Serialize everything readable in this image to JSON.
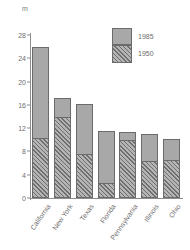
{
  "chart_data": {
    "type": "bar",
    "stacked": true,
    "title": "",
    "subtitle": "",
    "xlabel": "",
    "ylabel": "m",
    "unit_label": "m",
    "categories": [
      "California",
      "New York",
      "Texas",
      "Florida",
      "Pennsylvania",
      "Illinois",
      "Ohio"
    ],
    "series": [
      {
        "name": "1950",
        "values": [
          10.3,
          14.0,
          7.5,
          2.6,
          10.0,
          6.4,
          6.6
        ]
      },
      {
        "name": "1985",
        "values": [
          26.0,
          17.1,
          16.1,
          11.5,
          11.3,
          11.0,
          10.2
        ]
      }
    ],
    "note": "1985 values are cumulative bar tops; the 1950 segment is the hatched lower portion of each bar",
    "ylim": [
      0,
      28
    ],
    "yticks": [
      0,
      4,
      8,
      12,
      16,
      20,
      24,
      28
    ],
    "ytick_labels": [
      "0",
      "4",
      "8",
      "12",
      "16",
      "20",
      "24",
      "28"
    ],
    "grid": false,
    "legend_position": "top-right",
    "legend": [
      {
        "label": "1985",
        "swatch": "solid-gray"
      },
      {
        "label": "1950",
        "swatch": "hatched-gray"
      }
    ],
    "colors": {
      "upper_fill": "#a8a8a8",
      "lower_fill": "#9e9e9e",
      "hatch": "#6f6f6f",
      "outline": "#6b6b6b",
      "axis": "#8d8d8d",
      "text": "#6e6e6e",
      "background": "#ffffff"
    }
  }
}
